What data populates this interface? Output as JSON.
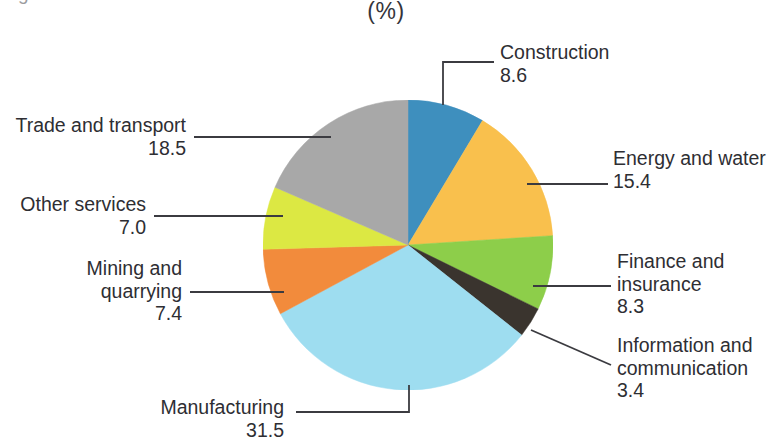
{
  "title_clipped": "g",
  "subtitle": "(%)",
  "chart_data": {
    "type": "pie",
    "title": "(%)",
    "subtitle": "(%)",
    "xlabel": "",
    "ylabel": "",
    "units": "percent",
    "legend_position": "callout-labels",
    "grid": false,
    "start_angle_deg": 0,
    "direction": "clockwise",
    "categories": [
      "Construction",
      "Energy and water",
      "Finance and insurance",
      "Information and communication",
      "Manufacturing",
      "Mining and quarrying",
      "Other services",
      "Trade and transport"
    ],
    "values": [
      8.6,
      15.4,
      8.3,
      3.4,
      31.5,
      7.4,
      7.0,
      18.5
    ],
    "colors": [
      "#3E8FBE",
      "#F9C04D",
      "#8DCE4A",
      "#3A342E",
      "#9EDDF0",
      "#F28B3C",
      "#DCE843",
      "#A8A8A8"
    ],
    "slices": [
      {
        "label": "Construction",
        "value": 8.6,
        "value_text": "8.6",
        "color": "#3E8FBE"
      },
      {
        "label": "Energy and water",
        "value": 15.4,
        "value_text": "15.4",
        "color": "#F9C04D"
      },
      {
        "label": "Finance and insurance",
        "value": 8.3,
        "value_text": "8.3",
        "color": "#8DCE4A"
      },
      {
        "label": "Information and communication",
        "value": 3.4,
        "value_text": "3.4",
        "color": "#3A342E"
      },
      {
        "label": "Manufacturing",
        "value": 31.5,
        "value_text": "31.5",
        "color": "#9EDDF0"
      },
      {
        "label": "Mining and quarrying",
        "value": 7.4,
        "value_text": "7.4",
        "color": "#F28B3C"
      },
      {
        "label": "Other services",
        "value": 7.0,
        "value_text": "7.0",
        "color": "#DCE843"
      },
      {
        "label": "Trade and transport",
        "value": 18.5,
        "value_text": "18.5",
        "color": "#A8A8A8"
      }
    ]
  },
  "labels": {
    "construction": {
      "name": "Construction",
      "value": "8.6"
    },
    "energy": {
      "name": "Energy and water",
      "value": "15.4"
    },
    "finance_l1": "Finance and",
    "finance_l2": "insurance",
    "finance_value": "8.3",
    "information_l1": "Information and",
    "information_l2": "communication",
    "information_value": "3.4",
    "manufacturing": {
      "name": "Manufacturing",
      "value": "31.5"
    },
    "mining_l1": "Mining and",
    "mining_l2": "quarrying",
    "mining_value": "7.4",
    "other_services": {
      "name": "Other services",
      "value": "7.0"
    },
    "trade": {
      "name": "Trade and transport",
      "value": "18.5"
    }
  }
}
